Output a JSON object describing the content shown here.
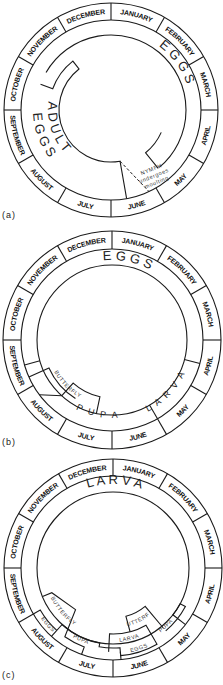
{
  "months": [
    "JANUARY",
    "FEBRUARY",
    "MARCH",
    "APRIL",
    "MAY",
    "JUNE",
    "JULY",
    "AUGUST",
    "SEPTEMBER",
    "OCTOBER",
    "NOVEMBER",
    "DECEMBER"
  ],
  "colors": {
    "line": "#1a1a1a",
    "text": "#222222",
    "background": "#ffffff"
  },
  "panels": [
    {
      "id": "a",
      "label": "(a)",
      "label_pos": [
        2,
        218
      ],
      "center": [
        111,
        110
      ],
      "r_outer": 107,
      "r_month": 90,
      "r_ring": 75,
      "draw_inner_ring_arc": [
        -60,
        140
      ],
      "regions": [
        {
          "name": "adult-region",
          "path": [
            [
              -70,
              75
            ],
            [
              -70,
              62
            ],
            [
              -38,
              62
            ],
            [
              -38,
              52
            ],
            [
              170,
              52
            ],
            [
              170,
              90
            ]
          ]
        },
        {
          "name": "nymph-region",
          "path": [
            [
              141,
              75
            ],
            [
              141,
              55
            ],
            [
              114,
              55
            ]
          ]
        }
      ],
      "dashed": [
        [
          170,
          52
        ],
        [
          155,
          90
        ]
      ],
      "texts": [
        {
          "text": "E  G  G  S",
          "cls": "big",
          "arc": {
            "r": 80,
            "start": 20,
            "end": 88
          }
        },
        {
          "text": "A D U L T",
          "cls": "big",
          "arc": {
            "r": 63,
            "start": 300,
            "end": 205,
            "reverse": true
          }
        },
        {
          "text": "E  G  G  S",
          "cls": "big",
          "arc": {
            "r": 78,
            "start": 292,
            "end": 208,
            "reverse": true
          }
        }
      ],
      "notes": [
        {
          "lines": [
            "NYMPH",
            "undergoes",
            "moulting"
          ],
          "pos": [
            152,
            171
          ],
          "rotate": -22
        }
      ]
    },
    {
      "id": "b",
      "label": "(b)",
      "label_pos": [
        2,
        445
      ],
      "center": [
        112,
        340
      ],
      "r_outer": 109,
      "r_month": 91,
      "r_ring": 75,
      "regions": [
        {
          "name": "eggs-larva-boundary",
          "path": [
            [
              105,
              91
            ],
            [
              105,
              75
            ]
          ]
        },
        {
          "name": "butterfly-region",
          "path": [
            [
              246,
              91
            ],
            [
              246,
              69
            ],
            [
              212,
              69
            ]
          ]
        },
        {
          "name": "butterfly-outer-link",
          "path": [
            [
              254,
              91
            ],
            [
              254,
              75
            ]
          ]
        },
        {
          "name": "pupa-region",
          "path": [
            [
              233,
              91
            ],
            [
              222,
              75
            ],
            [
              222,
              58
            ],
            [
              192,
              58
            ],
            [
              192,
              75
            ]
          ]
        },
        {
          "name": "larva-region",
          "path": [
            [
              150,
              91
            ],
            [
              150,
              75
            ]
          ]
        }
      ],
      "texts": [
        {
          "text": "E     G     G     S",
          "cls": "big",
          "arc": {
            "r": 80,
            "start": 322,
            "end": 60
          }
        },
        {
          "text": "BUTTERFLY",
          "cls": "small",
          "arc": {
            "r": 66,
            "start": 244,
            "end": 206,
            "reverse": true
          }
        },
        {
          "text": "P  U  P  A",
          "cls": "mid",
          "arc": {
            "r": 78,
            "start": 222,
            "end": 160,
            "reverse": true
          }
        },
        {
          "text": "L A R V A",
          "cls": "mid",
          "arc": {
            "r": 80,
            "start": 152,
            "end": 115,
            "reverse": true
          }
        }
      ]
    },
    {
      "id": "c",
      "label": "(c)",
      "label_pos": [
        2,
        678
      ],
      "center": [
        113,
        568
      ],
      "r_outer": 109,
      "r_month": 92,
      "r_ring": 76,
      "regions": [
        {
          "name": "butterfly-region-1",
          "path": [
            [
              248,
              76
            ],
            [
              248,
              66
            ],
            [
              222,
              56
            ],
            [
              215,
              84
            ],
            [
              200,
              84
            ],
            [
              200,
              92
            ]
          ]
        },
        {
          "name": "eggs-region-1",
          "path": [
            [
              240,
              92
            ],
            [
              240,
              84
            ],
            [
              222,
              84
            ]
          ]
        },
        {
          "name": "pupa-region-1",
          "path": [
            [
              222,
              92
            ],
            [
              222,
              76
            ],
            [
              190,
              76
            ],
            [
              190,
              80
            ],
            [
              175,
              80
            ],
            [
              175,
              92
            ]
          ]
        },
        {
          "name": "larva-region-2",
          "path": [
            [
              183,
              84
            ],
            [
              183,
              66
            ],
            [
              150,
              66
            ],
            [
              150,
              84
            ]
          ]
        },
        {
          "name": "eggs-region-2",
          "path": [
            [
              175,
              84
            ],
            [
              175,
              88
            ],
            [
              150,
              88
            ],
            [
              150,
              84
            ]
          ]
        },
        {
          "name": "butterfly-region-2",
          "path": [
            [
              165,
              66
            ],
            [
              165,
              50
            ],
            [
              140,
              50
            ],
            [
              140,
              78
            ]
          ]
        },
        {
          "name": "pupa-region-2",
          "path": [
            [
              140,
              82
            ],
            [
              118,
              82
            ],
            [
              118,
              76
            ],
            [
              128,
              76
            ],
            [
              128,
              92
            ]
          ]
        }
      ],
      "texts": [
        {
          "text": "L    A    R    V    A",
          "cls": "big",
          "arc": {
            "r": 84,
            "start": 300,
            "end": 62
          }
        },
        {
          "text": "BUTTERFLY",
          "cls": "small",
          "arc": {
            "r": 69,
            "start": 244,
            "end": 214,
            "reverse": true
          }
        },
        {
          "text": "EGGS",
          "cls": "small",
          "arc": {
            "r": 88,
            "start": 236,
            "end": 222,
            "reverse": true
          }
        },
        {
          "text": "PUPA",
          "cls": "small",
          "arc": {
            "r": 80,
            "start": 212,
            "end": 196,
            "reverse": true
          }
        },
        {
          "text": "LARVA",
          "cls": "small",
          "arc": {
            "r": 74,
            "start": 176,
            "end": 158,
            "reverse": true
          }
        },
        {
          "text": "BUTTERFLY",
          "cls": "small",
          "arc": {
            "r": 60,
            "start": 164,
            "end": 141,
            "reverse": true
          }
        },
        {
          "text": "EGGS",
          "cls": "small",
          "arc": {
            "r": 86,
            "start": 170,
            "end": 154,
            "reverse": true
          }
        },
        {
          "text": "PUPA",
          "cls": "small",
          "arc": {
            "r": 80,
            "start": 145,
            "end": 130,
            "reverse": true
          }
        }
      ]
    }
  ]
}
